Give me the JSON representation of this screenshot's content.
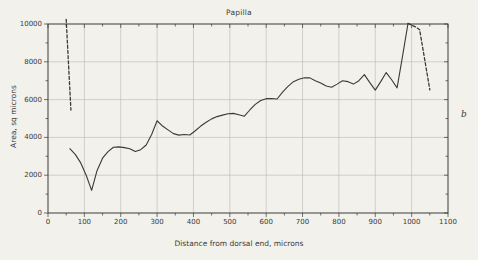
{
  "figure": {
    "panel_letter": "b",
    "background_color": "#f2f1ec",
    "ink_color": "#3a3a38",
    "grid_color": "#b9b8b2"
  },
  "chart_data": {
    "type": "line",
    "title": "Papilla",
    "xlabel": "Distance from dorsal end, microns",
    "ylabel": "Area, sq microns",
    "xlim": [
      0,
      1100
    ],
    "ylim": [
      0,
      10000
    ],
    "xticks": [
      0,
      100,
      200,
      300,
      400,
      500,
      600,
      700,
      800,
      900,
      1000,
      1100
    ],
    "yticks": [
      0,
      2000,
      4000,
      6000,
      8000,
      10000
    ],
    "xtick_labels": [
      "0",
      "100",
      "200",
      "300",
      "400",
      "500",
      "600",
      "700",
      "800",
      "900",
      "1000",
      "1100"
    ],
    "ytick_labels": [
      "0",
      "2000",
      "4000",
      "6000",
      "8000",
      "10000"
    ],
    "xtick_minor_step": 50,
    "ytick_minor_step": 1000,
    "grid": true,
    "legend": false,
    "series": [
      {
        "name": "papilla-area-solid",
        "style": "solid",
        "x": [
          60,
          75,
          90,
          105,
          120,
          135,
          150,
          165,
          180,
          195,
          210,
          225,
          240,
          255,
          270,
          285,
          300,
          315,
          330,
          345,
          360,
          375,
          390,
          405,
          420,
          435,
          450,
          465,
          480,
          495,
          510,
          525,
          540,
          555,
          570,
          585,
          600,
          615,
          630,
          645,
          660,
          675,
          690,
          705,
          720,
          735,
          750,
          765,
          780,
          795,
          810,
          825,
          840,
          855,
          870,
          885,
          900,
          915,
          930,
          945,
          960,
          975,
          990
        ],
        "y": [
          3400,
          3100,
          2650,
          2000,
          1200,
          2250,
          2900,
          3250,
          3480,
          3500,
          3460,
          3400,
          3250,
          3350,
          3600,
          4150,
          4880,
          4600,
          4400,
          4200,
          4120,
          4150,
          4130,
          4350,
          4600,
          4800,
          4980,
          5100,
          5180,
          5250,
          5270,
          5200,
          5120,
          5450,
          5750,
          5950,
          6050,
          6060,
          6030,
          6400,
          6700,
          6950,
          7080,
          7160,
          7150,
          7000,
          6880,
          6720,
          6650,
          6820,
          7000,
          6950,
          6820,
          7000,
          7320,
          6900,
          6500,
          6950,
          7430,
          7050,
          6620,
          8300,
          10030
        ]
      },
      {
        "name": "papilla-area-dashed-left",
        "style": "dashed",
        "x": [
          50,
          63
        ],
        "y": [
          10250,
          5450
        ]
      },
      {
        "name": "papilla-area-dashed-right",
        "style": "dashed",
        "x": [
          990,
          1012,
          1022,
          1050
        ],
        "y": [
          10030,
          9830,
          9700,
          6520
        ]
      }
    ]
  }
}
